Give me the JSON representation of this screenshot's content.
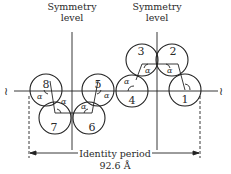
{
  "diagram": {
    "symmetry_labels": [
      {
        "line1": "Symmetry",
        "line2": "level"
      },
      {
        "line1": "Symmetry",
        "line2": "level"
      }
    ],
    "circles": [
      {
        "id": "1",
        "label": "1"
      },
      {
        "id": "2",
        "label": "2"
      },
      {
        "id": "3",
        "label": "3"
      },
      {
        "id": "4",
        "label": "4"
      },
      {
        "id": "5",
        "label": "5"
      },
      {
        "id": "6",
        "label": "6"
      },
      {
        "id": "7",
        "label": "7"
      },
      {
        "id": "8",
        "label": "8"
      }
    ],
    "angle_symbol": "α",
    "period_label": "Identity period",
    "period_value": "92.6 Å",
    "break_symbol": "≀"
  }
}
